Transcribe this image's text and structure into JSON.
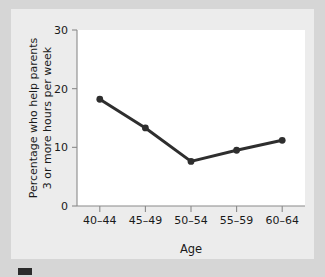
{
  "chart_data": {
    "type": "line",
    "title": "",
    "subtitle": "",
    "xlabel": "Age",
    "ylabel": "Percentage who help parents 3 or more hours per week",
    "ylabel_lines": [
      "Percentage who help parents",
      "3 or more hours per week"
    ],
    "categories": [
      "40–44",
      "45–49",
      "50–54",
      "55–59",
      "60–64"
    ],
    "values": [
      18.2,
      13.3,
      7.6,
      9.5,
      11.2
    ],
    "series": [
      {
        "name": "Percentage who help parents 3 or more hours per week",
        "values": [
          18.2,
          13.3,
          7.6,
          9.5,
          11.2
        ]
      }
    ],
    "ylim": [
      0,
      30
    ],
    "yticks": [
      0,
      10,
      20,
      30
    ],
    "ytick_labels": [
      "0",
      "10",
      "20",
      "30"
    ],
    "xticks": [
      "40–44",
      "45–49",
      "50–54",
      "55–59",
      "60–64"
    ],
    "grid": false,
    "legend": false,
    "legend_position": "none",
    "marker": "circle",
    "line_color": "#2e2e2e",
    "marker_color": "#2e2e2e",
    "plot_background": "#ffffff",
    "panel_background": "#ececec",
    "figure_background": "#d6d6d6",
    "axis_color": "#8a8a8a"
  }
}
